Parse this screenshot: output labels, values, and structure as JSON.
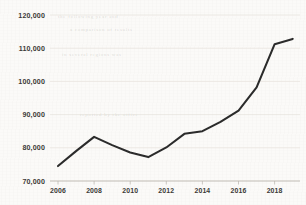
{
  "chart_data": {
    "type": "line",
    "title": "",
    "subtitle": "",
    "xlabel": "",
    "ylabel": "",
    "x": [
      2006,
      2007,
      2008,
      2009,
      2010,
      2011,
      2012,
      2013,
      2014,
      2015,
      2016,
      2017,
      2018,
      2019
    ],
    "values": [
      74500,
      79000,
      83300,
      80800,
      78600,
      77200,
      80100,
      84200,
      85000,
      87800,
      91200,
      98200,
      111200,
      112800
    ],
    "series": [
      {
        "name": "series-1",
        "color": "#2b2b2b",
        "values": [
          74500,
          79000,
          83300,
          80800,
          78600,
          77200,
          80100,
          84200,
          85000,
          87800,
          91200,
          98200,
          111200,
          112800
        ]
      }
    ],
    "xlim": [
      2006,
      2019
    ],
    "ylim": [
      70000,
      120000
    ],
    "ytick_values": [
      70000,
      80000,
      90000,
      100000,
      110000,
      120000
    ],
    "ytick_labels": [
      "70,000",
      "80,000",
      "90,000",
      "100,000",
      "110,000",
      "120,000"
    ],
    "xtick_values": [
      2006,
      2008,
      2010,
      2012,
      2014,
      2016,
      2018
    ],
    "xtick_labels": [
      "2006",
      "2008",
      "2010",
      "2012",
      "2014",
      "2016",
      "2018"
    ],
    "grid": true,
    "grid_axis": "y",
    "legend": false,
    "legend_position": "none",
    "line_color": "#2b2b2b",
    "grid_color": "#e6e2dc",
    "axis_color": "#b9b4ad",
    "background_color": "#fbfaf8",
    "text_color": "#3c3a37"
  },
  "artifacts": {
    "bleed_text": [
      "the following year and",
      "a comparison of results",
      "in several regions was",
      "reported by the office"
    ]
  }
}
